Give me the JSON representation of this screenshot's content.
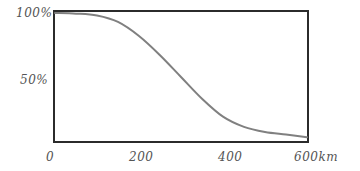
{
  "chart_data": {
    "type": "line",
    "title": "",
    "xlabel": "km",
    "ylabel": "",
    "xlim": [
      0,
      600
    ],
    "ylim": [
      0,
      100
    ],
    "grid": false,
    "legend": null,
    "x_ticks": [
      "0",
      "200",
      "400",
      "600 km"
    ],
    "y_ticks": [
      "50%",
      "100%"
    ],
    "series": [
      {
        "name": "curve",
        "color": "#808080",
        "x": [
          0,
          50,
          100,
          150,
          200,
          250,
          300,
          350,
          400,
          450,
          500,
          550,
          600
        ],
        "values": [
          100,
          99.5,
          98,
          93,
          82,
          67,
          50,
          33,
          19,
          11,
          7,
          5,
          3
        ]
      }
    ]
  },
  "labels": {
    "y100": "100%",
    "y50": "50%",
    "x0": "0",
    "x200": "200",
    "x400": "400",
    "x600": "600km"
  },
  "colors": {
    "frame": "#2b2b2b",
    "curve": "#808080",
    "text": "#555555"
  }
}
